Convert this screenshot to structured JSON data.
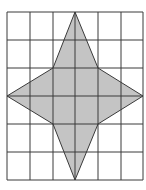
{
  "diagram": {
    "type": "grid-with-shaded-star",
    "grid": {
      "columns": 6,
      "rows": 6,
      "x_lines": [
        7,
        30,
        53,
        75,
        98,
        121,
        143
      ],
      "y_lines": [
        12,
        40,
        68,
        96,
        124,
        152,
        180
      ],
      "line_color": "#3a3a3a"
    },
    "shape": {
      "name": "four-pointed star",
      "fill": "#c4c4c4",
      "stroke": "#3a3a3a",
      "vertices_grid": [
        [
          3,
          0
        ],
        [
          4,
          2
        ],
        [
          6,
          3
        ],
        [
          4,
          4
        ],
        [
          3,
          6
        ],
        [
          2,
          4
        ],
        [
          0,
          3
        ],
        [
          2,
          2
        ]
      ],
      "points": "75,12 98,68 143,96 98,124 75,180 53,124 7,96 53,68"
    }
  }
}
